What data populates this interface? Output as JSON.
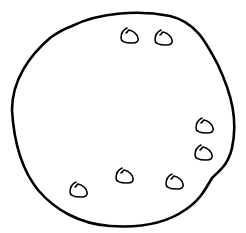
{
  "drawing": {
    "subject": "chocolate chip cookie outline",
    "stroke_color": "#000000",
    "background_color": "#ffffff",
    "chip_count": 7,
    "chips": [
      {
        "id": "chip-1"
      },
      {
        "id": "chip-2"
      },
      {
        "id": "chip-3"
      },
      {
        "id": "chip-4"
      },
      {
        "id": "chip-5"
      },
      {
        "id": "chip-6"
      },
      {
        "id": "chip-7"
      }
    ]
  }
}
